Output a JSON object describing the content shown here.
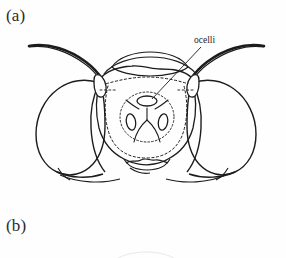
{
  "figure": {
    "background_color": "#fefefe",
    "ink_color": "#1c1c1c",
    "panels": [
      {
        "id": "a",
        "label": "(a)",
        "subject": "insect head, frontal view line drawing",
        "annotations": [
          {
            "id": "ocelli",
            "label": "ocelli",
            "target": "median ocellus",
            "leader_line": true
          }
        ],
        "parts": [
          "left antenna",
          "right antenna",
          "left antennal scape",
          "right antennal scape",
          "left compound eye",
          "right compound eye",
          "vertex",
          "frons",
          "median ocellus",
          "left lateral ocellus",
          "right lateral ocellus",
          "clypeus",
          "mandibles"
        ]
      },
      {
        "id": "b",
        "label": "(b)",
        "subject": "second panel, figure cropped at image edge",
        "annotations": [],
        "parts": []
      }
    ]
  },
  "labels": {
    "panel_a": "(a)",
    "panel_b": "(b)",
    "ocelli": "ocelli"
  }
}
